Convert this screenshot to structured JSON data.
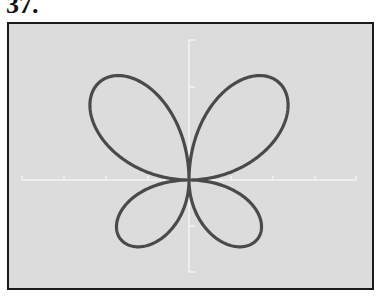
{
  "figure": {
    "label": "37.",
    "background_color": "#dcdcdc",
    "frame_color": "#1a1a1a",
    "axis_color": "#f4f4f4",
    "curve_color": "#4a4a4a"
  },
  "chart_data": {
    "type": "line",
    "title": "",
    "xlabel": "",
    "ylabel": "",
    "coordinate_system": "polar",
    "grid": false,
    "axes": {
      "x_ticks_count_each_side": 4,
      "y_ticks_up": 2,
      "y_ticks_down": 2,
      "tick_labels": []
    },
    "curve": {
      "form": "r = |sin(2θ)| · (a + b·sin θ)",
      "a": 111,
      "b": 30,
      "petals": [
        {
          "position": "upper-left",
          "size": "large"
        },
        {
          "position": "upper-right",
          "size": "large"
        },
        {
          "position": "lower-left",
          "size": "small"
        },
        {
          "position": "lower-right",
          "size": "small"
        }
      ]
    }
  }
}
